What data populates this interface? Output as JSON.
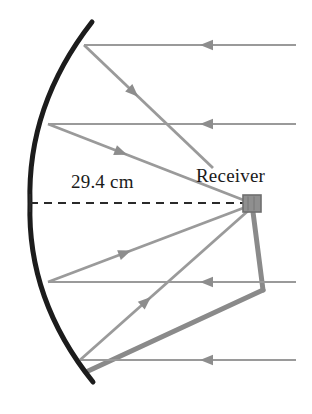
{
  "figure": {
    "labels": {
      "dimension": "29.4 cm",
      "receiver": "Receiver"
    },
    "colors": {
      "mirror": "#1c1c1c",
      "ray": "#9a9a9a",
      "ray_dark": "#8d8d8d",
      "support": "#8a8a8a",
      "receiver_box": "#8f8f8f",
      "receiver_box_border": "#6e6e6e",
      "dashed_axis": "#2a2a2a",
      "background": "#ffffff",
      "text": "#1a1a1a"
    },
    "geometry": {
      "mirror_arc": {
        "name": "parabolic-mirror",
        "start_x": 92,
        "start_y": 22,
        "vertex_x": 30,
        "vertex_y": 203,
        "end_x": 93,
        "end_y": 382,
        "stroke_width": 5
      },
      "focus": {
        "x": 250,
        "y": 204
      },
      "receiver_box": {
        "x": 243,
        "y": 195,
        "width": 18,
        "height": 17
      },
      "axis_dashed": {
        "x1": 30,
        "y1": 203,
        "x2": 246,
        "y2": 203
      },
      "incoming_rays": [
        {
          "name": "incoming-ray-1",
          "y": 45,
          "x_start": 296,
          "x_end": 84,
          "arrow_x": 200
        },
        {
          "name": "incoming-ray-2",
          "y": 124,
          "x_start": 296,
          "x_end": 48,
          "arrow_x": 200
        },
        {
          "name": "incoming-ray-3",
          "y": 282,
          "x_start": 296,
          "x_end": 48,
          "arrow_x": 200
        },
        {
          "name": "incoming-ray-4",
          "y": 360,
          "x_start": 296,
          "x_end": 80,
          "arrow_x": 200
        }
      ],
      "reflected_rays": [
        {
          "name": "reflected-ray-1",
          "x1": 84,
          "y1": 45,
          "x2": 213,
          "y2": 168,
          "arrow_t": 0.42
        },
        {
          "name": "reflected-ray-2",
          "x1": 48,
          "y1": 124,
          "x2": 246,
          "y2": 201,
          "arrow_t": 0.4
        },
        {
          "name": "reflected-ray-3",
          "x1": 48,
          "y1": 282,
          "x2": 246,
          "y2": 207,
          "arrow_t": 0.42
        },
        {
          "name": "reflected-ray-4",
          "x1": 80,
          "y1": 360,
          "x2": 249,
          "y2": 210,
          "arrow_t": 0.42
        }
      ],
      "support_struts": [
        {
          "name": "support-strut-vertical",
          "x1": 253,
          "y1": 212,
          "x2": 263,
          "y2": 290
        },
        {
          "name": "support-strut-diagonal",
          "x1": 263,
          "y1": 290,
          "x2": 86,
          "y2": 372
        }
      ]
    }
  }
}
